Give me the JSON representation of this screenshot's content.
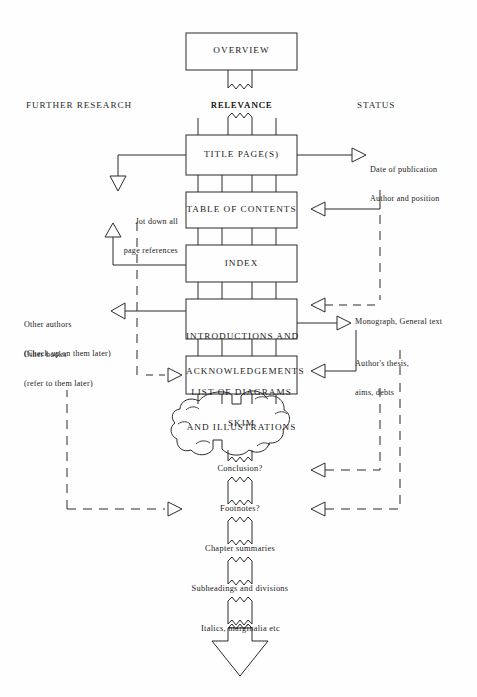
{
  "diagram": {
    "columns": [
      {
        "id": "further-research",
        "label": "FURTHER RESEARCH"
      },
      {
        "id": "relevance",
        "label": "RELEVANCE"
      },
      {
        "id": "status",
        "label": "STATUS"
      }
    ],
    "top_node": {
      "id": "overview",
      "label": "OVERVIEW"
    },
    "relevance_node": {
      "id": "relevance-node",
      "label": "RELEVANCE"
    },
    "boxes": [
      {
        "id": "title-pages",
        "label": "TITLE PAGE(S)"
      },
      {
        "id": "table-of-contents",
        "label": "TABLE OF CONTENTS"
      },
      {
        "id": "index",
        "label": "INDEX"
      },
      {
        "id": "introductions",
        "line1": "INTRODUCTIONS AND",
        "line2": "ACKNOWLEDGEMENTS"
      },
      {
        "id": "list-of-diagrams",
        "line1": "LIST OF DIAGRAMS",
        "line2": "AND ILLUSTRATIONS"
      }
    ],
    "cloud": {
      "id": "skim",
      "label": "SKIM"
    },
    "chain": [
      {
        "id": "conclusion",
        "label": "Conclusion?"
      },
      {
        "id": "footnotes",
        "label": "Footnotes?"
      },
      {
        "id": "chapter-summaries",
        "label": "Chapter summaries"
      },
      {
        "id": "subheadings",
        "label": "Subheadings and divisions"
      },
      {
        "id": "italics",
        "label": "Italics, marginalia etc"
      }
    ],
    "left_annotations": [
      {
        "id": "jot-down",
        "line1": "Jot down all",
        "line2": "page references"
      },
      {
        "id": "other-authors",
        "line1": "Other authors",
        "line2": "(Check up on them later)"
      },
      {
        "id": "other-books",
        "line1": "Other books",
        "line2": "(refer to them later)"
      }
    ],
    "right_annotations": [
      {
        "id": "date-of-publication",
        "line1": "Date of publication",
        "line2": "Author and position"
      },
      {
        "id": "monograph",
        "line1": "Monograph, General text",
        "line2": ""
      },
      {
        "id": "authors-thesis",
        "line1": "Author's thesis,",
        "line2": "aims, debts"
      }
    ],
    "colors": {
      "ink": "#1c1c1c",
      "line": "#2b2b2b",
      "background": "#fefefe"
    }
  }
}
